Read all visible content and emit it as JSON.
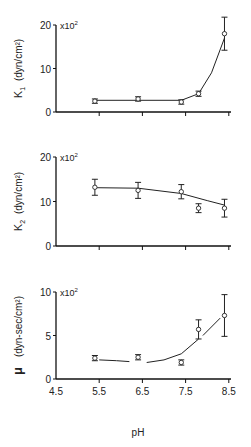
{
  "chart_data": [
    {
      "type": "scatter",
      "title": "",
      "ylabel": "K1 (dyn/cm²)",
      "ylabel_main": "K",
      "ylabel_sub": "1",
      "ylabel_unit": "(dyn/cm²)",
      "multiplier": "x10²",
      "xlabel": "",
      "xlim": [
        4.5,
        8.5
      ],
      "ylim": [
        0,
        20
      ],
      "yticks": [
        0,
        10,
        20
      ],
      "xticks": [
        5.5,
        6.5,
        7.5,
        8.5
      ],
      "grid": false,
      "x": [
        5.4,
        6.4,
        7.4,
        7.8,
        8.4
      ],
      "values": [
        2.5,
        3.0,
        2.3,
        4.2,
        18.0
      ],
      "err": [
        0.5,
        0.5,
        0.5,
        0.6,
        3.8
      ],
      "fit_curve": [
        [
          5.4,
          2.7
        ],
        [
          6.4,
          2.7
        ],
        [
          7.4,
          2.7
        ],
        [
          7.8,
          4.2
        ],
        [
          8.1,
          9
        ],
        [
          8.4,
          17
        ]
      ]
    },
    {
      "type": "scatter",
      "title": "",
      "ylabel": "K2 (dyn/cm²)",
      "ylabel_main": "K",
      "ylabel_sub": "2",
      "ylabel_unit": "(dyn/cm²)",
      "multiplier": "x10²",
      "xlabel": "",
      "xlim": [
        4.5,
        8.5
      ],
      "ylim": [
        0,
        20
      ],
      "yticks": [
        0,
        10,
        20
      ],
      "xticks": [
        5.5,
        6.5,
        7.5,
        8.5
      ],
      "grid": false,
      "x": [
        5.4,
        6.4,
        7.4,
        7.8,
        8.4
      ],
      "values": [
        13.2,
        12.5,
        12.2,
        8.5,
        8.5
      ],
      "err": [
        1.8,
        1.8,
        1.6,
        1.0,
        2.0
      ],
      "fit_curve": [
        [
          5.4,
          13.1
        ],
        [
          6.4,
          13.0
        ],
        [
          7.4,
          11.8
        ],
        [
          8.0,
          10.2
        ],
        [
          8.4,
          9.2
        ]
      ]
    },
    {
      "type": "scatter",
      "title": "",
      "ylabel": "μ (dyn-sec/cm²)",
      "ylabel_main": "μ",
      "ylabel_unit": "(dyn-sec/cm²)",
      "multiplier": "x10²",
      "xlabel": "pH",
      "xlim": [
        4.5,
        8.5
      ],
      "ylim": [
        0,
        10
      ],
      "yticks": [
        0,
        5,
        10
      ],
      "xticks": [
        4.5,
        5.5,
        6.5,
        7.5,
        8.5
      ],
      "grid": false,
      "x": [
        5.4,
        6.4,
        7.4,
        7.8,
        8.4
      ],
      "values": [
        2.4,
        2.5,
        1.9,
        5.7,
        7.3
      ],
      "err": [
        0.3,
        0.3,
        0.3,
        1.1,
        2.4
      ],
      "fit_curve_segments": [
        [
          [
            5.5,
            2.2
          ],
          [
            5.9,
            2.1
          ],
          [
            6.2,
            2.0
          ]
        ],
        [
          [
            6.6,
            1.9
          ],
          [
            7.0,
            2.2
          ],
          [
            7.4,
            2.9
          ],
          [
            7.8,
            4.6
          ]
        ],
        [
          [
            7.9,
            5.0
          ],
          [
            8.3,
            7.0
          ]
        ]
      ]
    }
  ]
}
